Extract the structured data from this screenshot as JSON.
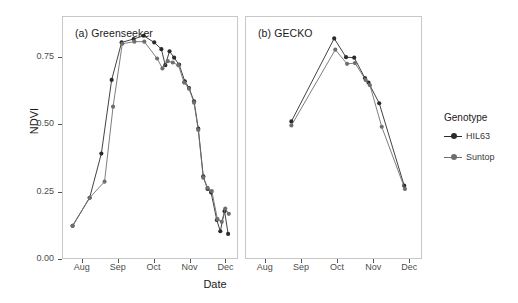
{
  "chart_data": {
    "type": "line",
    "title": "",
    "xlabel": "Date",
    "ylabel": "NDVI",
    "ylim": [
      0.0,
      0.9
    ],
    "yticks": [
      0.0,
      0.25,
      0.5,
      0.75
    ],
    "ytick_labels": [
      "0.00",
      "0.25",
      "0.50",
      "0.75"
    ],
    "xticks": [
      "Aug",
      "Sep",
      "Oct",
      "Nov",
      "Dec"
    ],
    "xtick_positions_month": [
      8,
      9,
      10,
      11,
      12
    ],
    "xlim_month": [
      7.45,
      12.35
    ],
    "grid": false,
    "legend_position": "right",
    "legend_title": "Genotype",
    "panels": [
      {
        "key": "a",
        "label": "(a) Greenseeker",
        "series": [
          {
            "name": "HIL63",
            "color": "#2b2b2b",
            "points": [
              {
                "x": 7.72,
                "y": 0.12
              },
              {
                "x": 8.2,
                "y": 0.225
              },
              {
                "x": 8.53,
                "y": 0.39
              },
              {
                "x": 8.82,
                "y": 0.665
              },
              {
                "x": 9.1,
                "y": 0.805
              },
              {
                "x": 9.44,
                "y": 0.818
              },
              {
                "x": 9.72,
                "y": 0.83
              },
              {
                "x": 10.02,
                "y": 0.805
              },
              {
                "x": 10.22,
                "y": 0.78
              },
              {
                "x": 10.33,
                "y": 0.72
              },
              {
                "x": 10.45,
                "y": 0.772
              },
              {
                "x": 10.58,
                "y": 0.748
              },
              {
                "x": 10.72,
                "y": 0.722
              },
              {
                "x": 10.88,
                "y": 0.66
              },
              {
                "x": 11.0,
                "y": 0.635
              },
              {
                "x": 11.14,
                "y": 0.585
              },
              {
                "x": 11.26,
                "y": 0.483
              },
              {
                "x": 11.4,
                "y": 0.305
              },
              {
                "x": 11.52,
                "y": 0.258
              },
              {
                "x": 11.62,
                "y": 0.245
              },
              {
                "x": 11.78,
                "y": 0.142
              },
              {
                "x": 11.88,
                "y": 0.1
              },
              {
                "x": 12.0,
                "y": 0.175
              },
              {
                "x": 12.1,
                "y": 0.09
              }
            ]
          },
          {
            "name": "Suntop",
            "color": "#6e6e6e",
            "points": [
              {
                "x": 7.72,
                "y": 0.12
              },
              {
                "x": 8.2,
                "y": 0.225
              },
              {
                "x": 8.62,
                "y": 0.285
              },
              {
                "x": 8.86,
                "y": 0.565
              },
              {
                "x": 9.12,
                "y": 0.8
              },
              {
                "x": 9.46,
                "y": 0.808
              },
              {
                "x": 9.74,
                "y": 0.808
              },
              {
                "x": 10.1,
                "y": 0.745
              },
              {
                "x": 10.25,
                "y": 0.708
              },
              {
                "x": 10.4,
                "y": 0.735
              },
              {
                "x": 10.54,
                "y": 0.73
              },
              {
                "x": 10.7,
                "y": 0.72
              },
              {
                "x": 10.86,
                "y": 0.655
              },
              {
                "x": 11.0,
                "y": 0.632
              },
              {
                "x": 11.14,
                "y": 0.58
              },
              {
                "x": 11.26,
                "y": 0.478
              },
              {
                "x": 11.4,
                "y": 0.3
              },
              {
                "x": 11.52,
                "y": 0.262
              },
              {
                "x": 11.64,
                "y": 0.25
              },
              {
                "x": 11.8,
                "y": 0.145
              },
              {
                "x": 11.92,
                "y": 0.135
              },
              {
                "x": 12.02,
                "y": 0.185
              },
              {
                "x": 12.12,
                "y": 0.165
              }
            ]
          }
        ]
      },
      {
        "key": "b",
        "label": "(b) GECKO",
        "series": [
          {
            "name": "HIL63",
            "color": "#2b2b2b",
            "points": [
              {
                "x": 8.72,
                "y": 0.51
              },
              {
                "x": 9.92,
                "y": 0.82
              },
              {
                "x": 10.25,
                "y": 0.75
              },
              {
                "x": 10.48,
                "y": 0.748
              },
              {
                "x": 10.78,
                "y": 0.672
              },
              {
                "x": 10.88,
                "y": 0.655
              },
              {
                "x": 11.18,
                "y": 0.578
              },
              {
                "x": 11.88,
                "y": 0.27
              }
            ]
          },
          {
            "name": "Suntop",
            "color": "#6e6e6e",
            "points": [
              {
                "x": 8.72,
                "y": 0.495
              },
              {
                "x": 9.95,
                "y": 0.778
              },
              {
                "x": 10.28,
                "y": 0.725
              },
              {
                "x": 10.5,
                "y": 0.728
              },
              {
                "x": 10.8,
                "y": 0.665
              },
              {
                "x": 10.92,
                "y": 0.645
              },
              {
                "x": 11.25,
                "y": 0.49
              },
              {
                "x": 11.9,
                "y": 0.258
              }
            ]
          }
        ]
      }
    ]
  },
  "legend": {
    "title": "Genotype",
    "entries": [
      {
        "label": "HIL63",
        "color": "#2b2b2b"
      },
      {
        "label": "Suntop",
        "color": "#6e6e6e"
      }
    ]
  },
  "axes": {
    "y_label": "NDVI",
    "x_label": "Date",
    "y_ticks": [
      "0.00",
      "0.25",
      "0.50",
      "0.75"
    ],
    "x_ticks": [
      "Aug",
      "Sep",
      "Oct",
      "Nov",
      "Dec"
    ]
  },
  "panel_titles": {
    "a": "(a) Greenseeker",
    "b": "(b) GECKO"
  }
}
